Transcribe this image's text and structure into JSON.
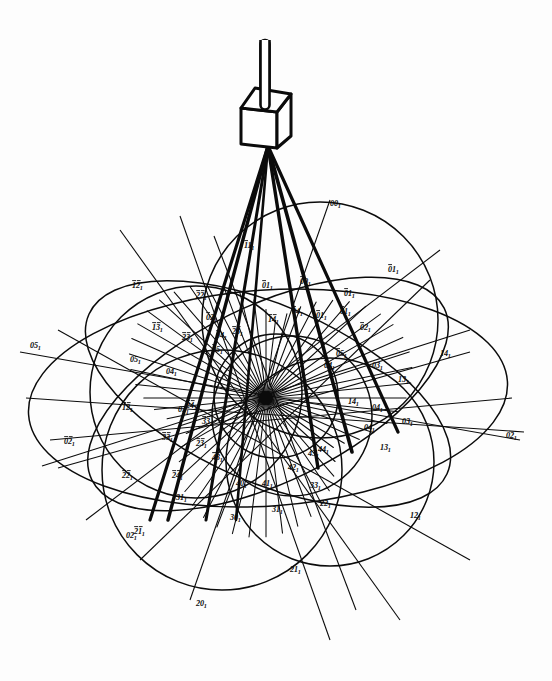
{
  "figure": {
    "background_color": "#ffffff",
    "ink_color": "#0b0b0b",
    "width": 552,
    "height": 681
  },
  "apparatus": {
    "stem": {
      "name": "goniometer-stem",
      "x": 265,
      "y_top": 40,
      "y_bottom": 105,
      "width": 9
    },
    "crystal": {
      "name": "cube-crystal",
      "shape": "cube-isometric",
      "cx": 265,
      "cy": 122,
      "half_width": 24,
      "half_height": 26,
      "depth": 12
    },
    "beam_origin": {
      "x": 268,
      "y": 146
    },
    "beam_rays": [
      {
        "name": "ray-1",
        "x2": 150,
        "y2": 520,
        "w": 3.2
      },
      {
        "name": "ray-2",
        "x2": 168,
        "y2": 520,
        "w": 3.4
      },
      {
        "name": "ray-3",
        "x2": 206,
        "y2": 520,
        "w": 3.0
      },
      {
        "name": "ray-4",
        "x2": 236,
        "y2": 520,
        "w": 2.6
      },
      {
        "name": "ray-5",
        "x2": 318,
        "y2": 468,
        "w": 3.4
      },
      {
        "name": "ray-6",
        "x2": 352,
        "y2": 452,
        "w": 3.6
      },
      {
        "name": "ray-7",
        "x2": 398,
        "y2": 432,
        "w": 3.2
      }
    ]
  },
  "projection": {
    "center": {
      "x": 266,
      "y": 398,
      "name": "projection-pole-001"
    },
    "radiating_lines": {
      "count": 56,
      "length": 152,
      "name": "zone-line-pencil"
    },
    "ellipses": [
      {
        "name": "zone-circle-outer-horizontal",
        "cx": 268,
        "cy": 398,
        "rx": 240,
        "ry": 108,
        "rot": -4
      },
      {
        "name": "zone-circle-upper-right",
        "cx": 320,
        "cy": 320,
        "rx": 118,
        "ry": 118,
        "rot": 0
      },
      {
        "name": "zone-circle-lower-left",
        "cx": 222,
        "cy": 470,
        "rx": 120,
        "ry": 120,
        "rot": 0
      },
      {
        "name": "zone-circle-lower-right",
        "cx": 330,
        "cy": 462,
        "rx": 104,
        "ry": 104,
        "rot": 0
      },
      {
        "name": "zone-circle-left",
        "cx": 196,
        "cy": 392,
        "rx": 106,
        "ry": 106,
        "rot": 0
      },
      {
        "name": "zone-circle-inner-small",
        "cx": 276,
        "cy": 396,
        "rx": 62,
        "ry": 62,
        "rot": 0
      },
      {
        "name": "zone-circle-tilted-a",
        "cx": 268,
        "cy": 394,
        "rx": 196,
        "ry": 88,
        "rot": 24
      },
      {
        "name": "zone-circle-tilted-b",
        "cx": 268,
        "cy": 394,
        "rx": 196,
        "ry": 88,
        "rot": -26
      },
      {
        "name": "zone-circle-mid",
        "cx": 292,
        "cy": 416,
        "rx": 80,
        "ry": 80,
        "rot": 0
      }
    ],
    "straight_zone_lines": [
      {
        "name": "zone-line-h1",
        "x1": 20,
        "y1": 352,
        "x2": 520,
        "y2": 440
      },
      {
        "name": "zone-line-h2",
        "x1": 26,
        "y1": 398,
        "x2": 524,
        "y2": 432
      },
      {
        "name": "zone-line-h3",
        "x1": 50,
        "y1": 440,
        "x2": 512,
        "y2": 398
      },
      {
        "name": "zone-line-h4",
        "x1": 58,
        "y1": 468,
        "x2": 470,
        "y2": 352
      },
      {
        "name": "zone-line-d1",
        "x1": 120,
        "y1": 230,
        "x2": 400,
        "y2": 620
      },
      {
        "name": "zone-line-d2",
        "x1": 180,
        "y1": 216,
        "x2": 330,
        "y2": 640
      },
      {
        "name": "zone-line-d3",
        "x1": 58,
        "y1": 330,
        "x2": 470,
        "y2": 560
      },
      {
        "name": "zone-line-d4",
        "x1": 86,
        "y1": 520,
        "x2": 440,
        "y2": 250
      },
      {
        "name": "zone-line-d5",
        "x1": 140,
        "y1": 560,
        "x2": 430,
        "y2": 280
      },
      {
        "name": "zone-line-d6",
        "x1": 330,
        "y1": 200,
        "x2": 190,
        "y2": 600
      },
      {
        "name": "zone-line-d7",
        "x1": 214,
        "y1": 236,
        "x2": 356,
        "y2": 610
      },
      {
        "name": "zone-line-d8",
        "x1": 42,
        "y1": 466,
        "x2": 470,
        "y2": 330
      }
    ]
  },
  "labels": [
    {
      "text": "001",
      "bar": "none",
      "x": 330,
      "y": 206,
      "name": "index-001-top"
    },
    {
      "text": "011",
      "bar": "first",
      "x": 388,
      "y": 272,
      "name": "index-bar011-upper-right"
    },
    {
      "text": "111",
      "bar": "first",
      "x": 244,
      "y": 248,
      "name": "index-bar111-upper"
    },
    {
      "text": "011",
      "bar": "first",
      "x": 262,
      "y": 288,
      "name": "index-bar011-upper-mid"
    },
    {
      "text": "001",
      "bar": "first",
      "x": 300,
      "y": 284,
      "name": "index-bar001-upper"
    },
    {
      "text": "011",
      "bar": "first",
      "x": 344,
      "y": 296,
      "name": "index-bar011-right-upper"
    },
    {
      "text": "021",
      "bar": "first",
      "x": 360,
      "y": 330,
      "name": "index-bar021-right"
    },
    {
      "text": "011",
      "bar": "first",
      "x": 340,
      "y": 314,
      "name": "index-bar011-right"
    },
    {
      "text": "121",
      "bar": "both",
      "x": 132,
      "y": 288,
      "name": "index-bar121-left-upper"
    },
    {
      "text": "221",
      "bar": "both",
      "x": 196,
      "y": 298,
      "name": "index-bar221-upper-left"
    },
    {
      "text": "131",
      "bar": "both",
      "x": 152,
      "y": 330,
      "name": "index-bar131-left"
    },
    {
      "text": "231",
      "bar": "both",
      "x": 182,
      "y": 340,
      "name": "index-bar231-left"
    },
    {
      "text": "141",
      "bar": "both",
      "x": 268,
      "y": 322,
      "name": "index-bar141-upper"
    },
    {
      "text": "041",
      "bar": "first",
      "x": 292,
      "y": 314,
      "name": "index-bar041-upper"
    },
    {
      "text": "011",
      "bar": "first",
      "x": 316,
      "y": 318,
      "name": "index-bar011-center-upper"
    },
    {
      "text": "051",
      "bar": "none",
      "x": 30,
      "y": 348,
      "name": "index-051-far-left"
    },
    {
      "text": "051",
      "bar": "none",
      "x": 130,
      "y": 362,
      "name": "index-051-left"
    },
    {
      "text": "041",
      "bar": "none",
      "x": 166,
      "y": 374,
      "name": "index-041-left-inner"
    },
    {
      "text": "031",
      "bar": "none",
      "x": 178,
      "y": 412,
      "name": "index-031-left-lower"
    },
    {
      "text": "141",
      "bar": "none",
      "x": 440,
      "y": 356,
      "name": "index-141-right"
    },
    {
      "text": "131",
      "bar": "none",
      "x": 398,
      "y": 382,
      "name": "index-131-right"
    },
    {
      "text": "031",
      "bar": "none",
      "x": 372,
      "y": 368,
      "name": "index-031-right"
    },
    {
      "text": "041",
      "bar": "none",
      "x": 372,
      "y": 410,
      "name": "index-041-right"
    },
    {
      "text": "141",
      "bar": "none",
      "x": 348,
      "y": 404,
      "name": "index-141-right-inner"
    },
    {
      "text": "031",
      "bar": "none",
      "x": 402,
      "y": 424,
      "name": "index-031-right-lower"
    },
    {
      "text": "021",
      "bar": "none",
      "x": 506,
      "y": 438,
      "name": "index-021-far-right"
    },
    {
      "text": "121",
      "bar": "none",
      "x": 410,
      "y": 518,
      "name": "index-121-right-lower"
    },
    {
      "text": "131",
      "bar": "none",
      "x": 380,
      "y": 450,
      "name": "index-131-lower-right"
    },
    {
      "text": "021",
      "bar": "both",
      "x": 64,
      "y": 444,
      "name": "index-bar021-left"
    },
    {
      "text": "121",
      "bar": "both",
      "x": 122,
      "y": 410,
      "name": "index-bar121-left"
    },
    {
      "text": "221",
      "bar": "both",
      "x": 122,
      "y": 478,
      "name": "index-bar221-lower-left"
    },
    {
      "text": "211",
      "bar": "both",
      "x": 134,
      "y": 534,
      "name": "index-bar211-lower-left"
    },
    {
      "text": "331",
      "bar": "both",
      "x": 162,
      "y": 440,
      "name": "index-bar331-left"
    },
    {
      "text": "231",
      "bar": "both",
      "x": 196,
      "y": 446,
      "name": "index-bar231-lower"
    },
    {
      "text": "431",
      "bar": "both",
      "x": 212,
      "y": 460,
      "name": "index-bar431-lower"
    },
    {
      "text": "331",
      "bar": "both",
      "x": 202,
      "y": 424,
      "name": "index-bar331-mid"
    },
    {
      "text": "241",
      "bar": "both",
      "x": 186,
      "y": 408,
      "name": "index-bar241-mid"
    },
    {
      "text": "241",
      "bar": "both",
      "x": 172,
      "y": 478,
      "name": "index-bar241-lower"
    },
    {
      "text": "311",
      "bar": "none",
      "x": 176,
      "y": 500,
      "name": "index-311-lower-left"
    },
    {
      "text": "301",
      "bar": "none",
      "x": 230,
      "y": 520,
      "name": "index-301-bottom"
    },
    {
      "text": "311",
      "bar": "none",
      "x": 272,
      "y": 512,
      "name": "index-311-bottom"
    },
    {
      "text": "401",
      "bar": "none",
      "x": 236,
      "y": 486,
      "name": "index-401-lower"
    },
    {
      "text": "411",
      "bar": "none",
      "x": 262,
      "y": 486,
      "name": "index-411-lower"
    },
    {
      "text": "421",
      "bar": "none",
      "x": 288,
      "y": 470,
      "name": "index-421-lower"
    },
    {
      "text": "431",
      "bar": "none",
      "x": 308,
      "y": 456,
      "name": "index-431-lower"
    },
    {
      "text": "441",
      "bar": "none",
      "x": 318,
      "y": 452,
      "name": "index-441-lower"
    },
    {
      "text": "331",
      "bar": "none",
      "x": 310,
      "y": 488,
      "name": "index-331-lower"
    },
    {
      "text": "221",
      "bar": "none",
      "x": 320,
      "y": 506,
      "name": "index-221-lower"
    },
    {
      "text": "201",
      "bar": "none",
      "x": 196,
      "y": 606,
      "name": "index-201-bottom"
    },
    {
      "text": "211",
      "bar": "none",
      "x": 290,
      "y": 572,
      "name": "index-211-bottom"
    },
    {
      "text": "021",
      "bar": "none",
      "x": 126,
      "y": 538,
      "name": "index-021-lower-left"
    },
    {
      "text": "041",
      "bar": "none",
      "x": 364,
      "y": 430,
      "name": "index-041-mid-right"
    },
    {
      "text": "051",
      "bar": "first",
      "x": 336,
      "y": 356,
      "name": "index-bar051-right"
    },
    {
      "text": "041",
      "bar": "first",
      "x": 324,
      "y": 368,
      "name": "index-bar041-right"
    },
    {
      "text": "051",
      "bar": "first",
      "x": 212,
      "y": 352,
      "name": "index-bar051-left-inner"
    },
    {
      "text": "041",
      "bar": "first",
      "x": 216,
      "y": 338,
      "name": "index-bar041-left-inner"
    },
    {
      "text": "021",
      "bar": "first",
      "x": 206,
      "y": 320,
      "name": "index-bar021-upper"
    },
    {
      "text": "231",
      "bar": "both",
      "x": 232,
      "y": 334,
      "name": "index-bar231-upper"
    }
  ]
}
